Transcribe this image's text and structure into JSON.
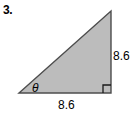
{
  "problem": {
    "number": "3."
  },
  "figure": {
    "type": "right-triangle",
    "fill_color": "#bcbcbc",
    "stroke_color": "#4d4d4d",
    "background_color": "#ffffff",
    "vertices": {
      "apex": [
        111,
        11
      ],
      "left": [
        19,
        93
      ],
      "right_angle": [
        111,
        93
      ]
    },
    "right_angle_marker": {
      "size": 8,
      "present": true
    }
  },
  "labels": {
    "vertical_side": "8.6",
    "horizontal_side": "8.6",
    "angle": "θ"
  }
}
